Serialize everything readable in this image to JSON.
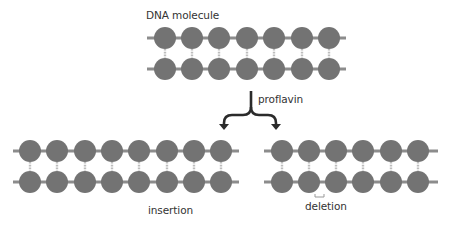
{
  "labels": {
    "title": "DNA molecule",
    "agent": "proflavin",
    "left_result": "insertion",
    "right_result": "deletion"
  },
  "colors": {
    "base": "#737373",
    "backbone": "#8c8c8c",
    "rung": "#bdbdbd",
    "arrow": "#2b2b2b",
    "text": "#333333"
  },
  "molecules": [
    {
      "name": "original",
      "x_start": 147,
      "x_end": 346,
      "top_y": 38,
      "bottom_y": 69,
      "bases_x": [
        165,
        192,
        219,
        247,
        274,
        302,
        329
      ]
    },
    {
      "name": "insertion",
      "x_start": 13,
      "x_end": 239,
      "top_y": 151,
      "bottom_y": 182,
      "bases_x": [
        30,
        57,
        85,
        112,
        139,
        167,
        194,
        221
      ]
    },
    {
      "name": "deletion",
      "x_start": 264,
      "x_end": 438,
      "top_y": 151,
      "bottom_y": 182,
      "bases_x": [
        282,
        309,
        336,
        363,
        391,
        418
      ]
    }
  ],
  "base_radius": 11,
  "deletion_marker": {
    "x1": 315,
    "x2": 324,
    "y": 197
  }
}
